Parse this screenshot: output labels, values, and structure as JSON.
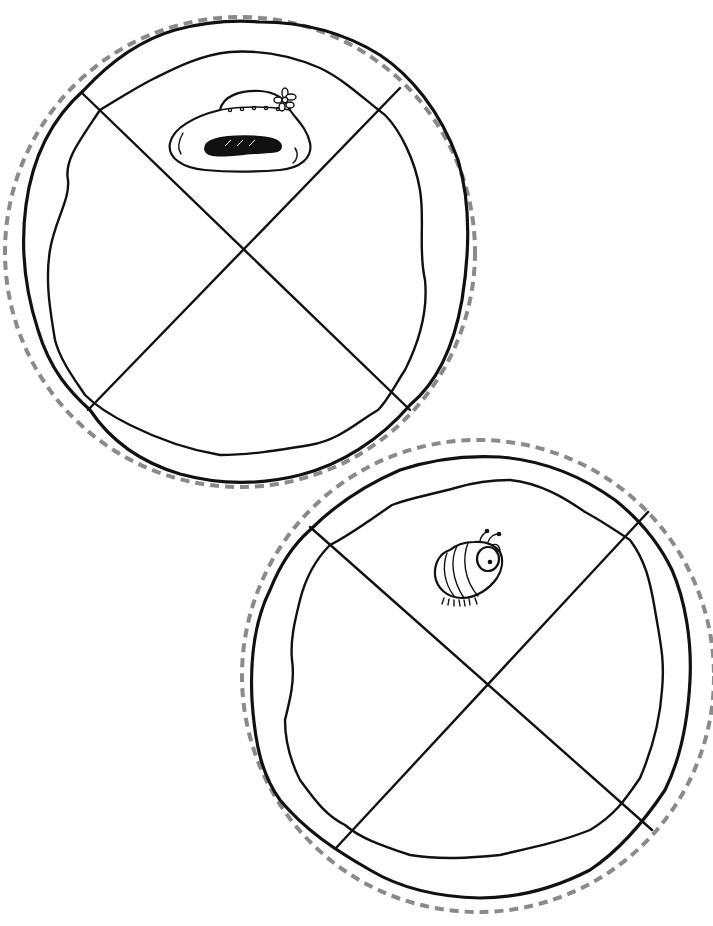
{
  "page": {
    "background_color": "#ffffff",
    "cut_line_color": "#8a8a8a",
    "ink_color": "#111111"
  },
  "pies": [
    {
      "id": "top-pie",
      "label": "Pie with hat",
      "center": [
        242,
        247
      ],
      "cut_radius": 235,
      "crust_radius": 222,
      "slices": 4,
      "picture": "hat-icon",
      "picture_position": "top slice"
    },
    {
      "id": "bottom-pie",
      "label": "Pie with bug",
      "center": [
        480,
        675
      ],
      "cut_radius": 236,
      "crust_radius": 222,
      "slices": 4,
      "picture": "bug-icon",
      "picture_position": "top slice"
    }
  ]
}
